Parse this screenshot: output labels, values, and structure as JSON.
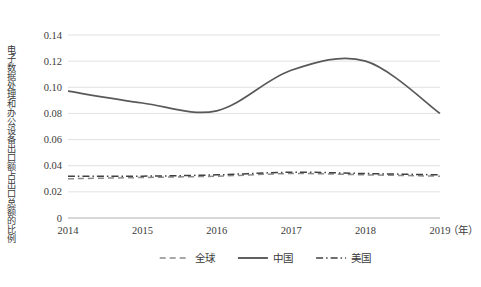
{
  "chart_data": {
    "type": "line",
    "title": "",
    "xlabel": "（年）",
    "ylabel": "电子数据处理和办公设备出口额占出口总额的比例",
    "categories": [
      "2014",
      "2015",
      "2016",
      "2017",
      "2018",
      "2019"
    ],
    "x": [
      2014,
      2015,
      2016,
      2017,
      2018,
      2019
    ],
    "xlim": [
      2014,
      2019
    ],
    "ylim": [
      0,
      0.14
    ],
    "yticks": [
      "0",
      "0.02",
      "0.04",
      "0.06",
      "0.08",
      "0.10",
      "0.12",
      "0.14"
    ],
    "ytick_values": [
      0,
      0.02,
      0.04,
      0.06,
      0.08,
      0.1,
      0.12,
      0.14
    ],
    "grid": "horizontal",
    "legend_position": "bottom",
    "series": [
      {
        "name": "全球",
        "style": "dashed",
        "color": "#8c8c8c",
        "values": [
          0.03,
          0.031,
          0.032,
          0.034,
          0.033,
          0.032
        ]
      },
      {
        "name": "中国",
        "style": "solid",
        "color": "#595959",
        "values": [
          0.097,
          0.088,
          0.082,
          0.113,
          0.12,
          0.08
        ]
      },
      {
        "name": "美国",
        "style": "dashdot",
        "color": "#404040",
        "values": [
          0.032,
          0.032,
          0.033,
          0.035,
          0.034,
          0.033
        ]
      }
    ]
  },
  "axes": {
    "y_tick_labels": [
      "0.14",
      "0.12",
      "0.10",
      "0.08",
      "0.06",
      "0.04",
      "0.02",
      "0"
    ],
    "x_tick_labels": [
      "2014",
      "2015",
      "2016",
      "2017",
      "2018",
      "2019"
    ],
    "x_unit": "（年）",
    "y_axis_title": "电子数据处理和办公设备出口额占出口总额的比例"
  },
  "legend": {
    "items": [
      {
        "label": "全球",
        "style": "dashed"
      },
      {
        "label": "中国",
        "style": "solid"
      },
      {
        "label": "美国",
        "style": "dashdot"
      }
    ]
  },
  "colors": {
    "grid": "#d9d9d9",
    "axis": "#bfbfbf",
    "text": "#3a3a3a",
    "global_line": "#8c8c8c",
    "china_line": "#595959",
    "usa_line": "#404040",
    "background": "#ffffff"
  }
}
